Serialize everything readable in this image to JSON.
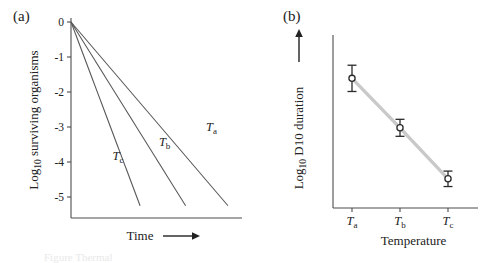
{
  "figure": {
    "panel_a_label": "(a)",
    "panel_b_label": "(b)",
    "caption": "Figure  Thermal"
  },
  "chart_data": [
    {
      "type": "line",
      "panel": "(a)",
      "title": "",
      "xlabel": "Time",
      "xlabel_arrow": "⟶",
      "ylabel_prefix": "Log",
      "ylabel_sub": "10",
      "ylabel_suffix": " surviving organisms",
      "ylabel": "Log10 surviving organisms",
      "yticks": [
        "0",
        "-1",
        "-2",
        "-3",
        "-4",
        "-5"
      ],
      "ytick_values": [
        0,
        -1,
        -2,
        -3,
        -4,
        -5
      ],
      "ylim": [
        -5.6,
        0.2
      ],
      "xlim": [
        0,
        10
      ],
      "xticks": [],
      "grid": false,
      "legend": "inline-curve-labels",
      "series": [
        {
          "name": "Ta",
          "label_main": "T",
          "label_sub": "a",
          "x": [
            0,
            10
          ],
          "values": [
            0,
            -5.25
          ],
          "slope_per_unit_time": -0.525,
          "label_x": 8.6,
          "label_y": -3.1
        },
        {
          "name": "Tb",
          "label_main": "T",
          "label_sub": "b",
          "x": [
            0,
            7.3
          ],
          "values": [
            0,
            -5.25
          ],
          "slope_per_unit_time": -0.719,
          "label_x": 5.6,
          "label_y": -3.55
        },
        {
          "name": "Tc",
          "label_main": "T",
          "label_sub": "c",
          "x": [
            0,
            4.4
          ],
          "values": [
            0,
            -5.25
          ],
          "slope_per_unit_time": -1.193,
          "label_x": 2.65,
          "label_y": -3.95
        }
      ]
    },
    {
      "type": "scatter",
      "panel": "(b)",
      "title": "",
      "xlabel": "Temperature",
      "ylabel_prefix": "Log",
      "ylabel_sub": "10",
      "ylabel_suffix": " D10 duration",
      "ylabel": "Log10 D10 duration",
      "ylabel_arrow": "↑",
      "grid": false,
      "xticks": [
        "Ta",
        "Tb",
        "Tc"
      ],
      "xtick_main": [
        "T",
        "T",
        "T"
      ],
      "xtick_sub": [
        "a",
        "b",
        "c"
      ],
      "ylim": [
        0,
        1
      ],
      "series": [
        {
          "name": "D10 duration",
          "categories": [
            "Ta",
            "Tb",
            "Tc"
          ],
          "values": [
            0.8,
            0.48,
            0.15
          ],
          "errors": [
            0.085,
            0.055,
            0.05
          ],
          "marker": "open-circle",
          "trend": "decreasing-linear"
        }
      ]
    }
  ]
}
